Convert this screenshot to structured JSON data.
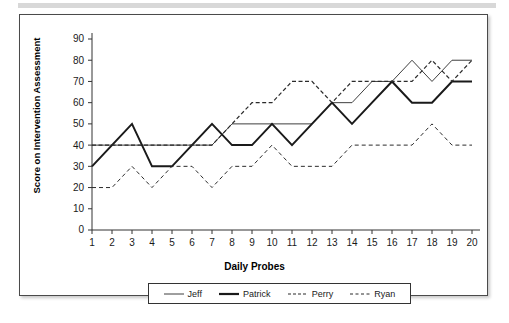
{
  "chart_data": {
    "type": "line",
    "title": "",
    "xlabel": "Daily Probes",
    "ylabel": "Score on Intervention Assessment",
    "x": [
      1,
      2,
      3,
      4,
      5,
      6,
      7,
      8,
      9,
      10,
      11,
      12,
      13,
      14,
      15,
      16,
      17,
      18,
      19,
      20
    ],
    "xtick_labels": [
      "1",
      "2",
      "3",
      "4",
      "5",
      "6",
      "7",
      "8",
      "9",
      "10",
      "11",
      "12",
      "13",
      "14",
      "15",
      "16",
      "17",
      "18",
      "19",
      "20"
    ],
    "ytick_labels": [
      "0",
      "10",
      "20",
      "30",
      "40",
      "50",
      "60",
      "70",
      "80",
      "90"
    ],
    "yticks": [
      0,
      10,
      20,
      30,
      40,
      50,
      60,
      70,
      80,
      90
    ],
    "ylim": [
      0,
      90
    ],
    "xlim": [
      1,
      20
    ],
    "grid": false,
    "legend_position": "bottom",
    "series": [
      {
        "name": "Jeff",
        "style": "solid-thin",
        "color": "#3f3f3f",
        "values": [
          40,
          40,
          40,
          40,
          40,
          40,
          40,
          50,
          50,
          50,
          50,
          50,
          60,
          60,
          70,
          70,
          80,
          70,
          80,
          80
        ]
      },
      {
        "name": "Patrick",
        "style": "solid-thick",
        "color": "#1a1a1a",
        "values": [
          30,
          40,
          50,
          30,
          30,
          40,
          50,
          40,
          40,
          50,
          40,
          50,
          60,
          50,
          60,
          70,
          60,
          60,
          70,
          70
        ]
      },
      {
        "name": "Perry",
        "style": "dashed-short",
        "color": "#2b2b2b",
        "values": [
          40,
          40,
          40,
          40,
          40,
          40,
          40,
          50,
          60,
          60,
          70,
          70,
          60,
          70,
          70,
          70,
          70,
          80,
          70,
          80
        ]
      },
      {
        "name": "Ryan",
        "style": "dashed-long",
        "color": "#2b2b2b",
        "values": [
          20,
          20,
          30,
          20,
          30,
          30,
          20,
          30,
          30,
          40,
          30,
          30,
          30,
          40,
          40,
          40,
          40,
          50,
          40,
          40
        ]
      }
    ]
  },
  "legend": {
    "entries": [
      {
        "label": "Jeff",
        "swatch": "solid-thin-line-icon"
      },
      {
        "label": "Patrick",
        "swatch": "solid-thick-line-icon"
      },
      {
        "label": "Perry",
        "swatch": "dashed-short-line-icon"
      },
      {
        "label": "Ryan",
        "swatch": "dashed-long-line-icon"
      }
    ]
  }
}
